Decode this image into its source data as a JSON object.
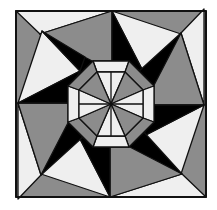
{
  "figure": {
    "colors": {
      "background": "#ffffff",
      "white": "#efefef",
      "gray": "#8c8c8c",
      "black": "#000000",
      "stroke": "#111111"
    }
  }
}
